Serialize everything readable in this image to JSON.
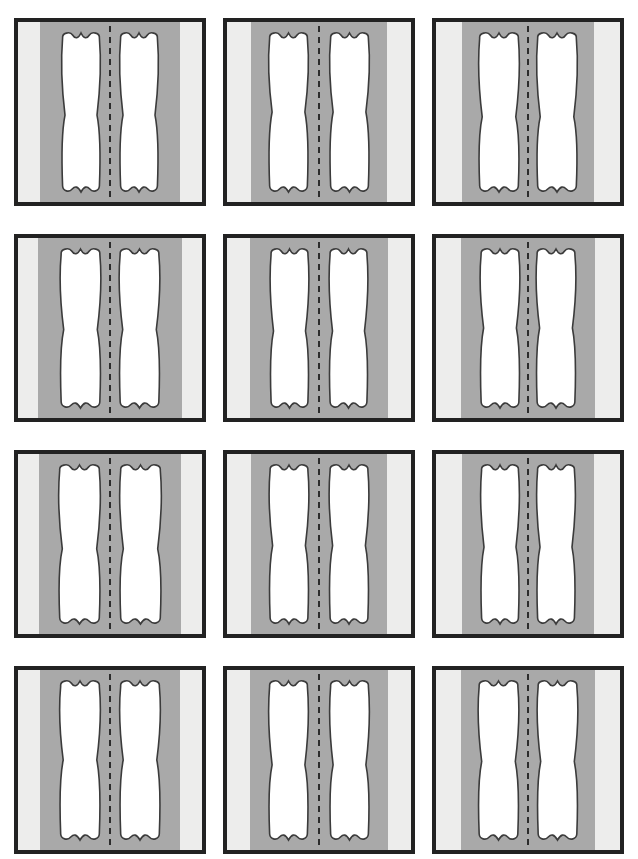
{
  "page": {
    "header_text": "",
    "background_color": "#ffffff",
    "width": 638,
    "height": 859
  },
  "grid": {
    "columns": 3,
    "rows": 4,
    "panel_count": 12,
    "panel_width": 192,
    "panel_height": 188
  },
  "palette": {
    "border": "#222222",
    "outer_band": "#ededec",
    "inner_band": "#a9a9a9",
    "shape_fill": "#ffffff",
    "shape_stroke": "#3b3b3b",
    "center_dash": "#1f1f1f"
  },
  "panel_legend": {
    "border_label": "panel-border",
    "outer_band_label": "outer light band",
    "inner_band_label": "inner gray matrix",
    "shape_label": "organic lumen shape",
    "center_label": "dashed symmetry axis"
  },
  "panels": [
    {
      "id": "panel-1",
      "index": "1",
      "inner_left": 22,
      "inner_right": 22,
      "shape_width": 40,
      "gap": 18,
      "waist": 0.52
    },
    {
      "id": "panel-2",
      "index": "2",
      "inner_left": 24,
      "inner_right": 24,
      "shape_width": 41,
      "gap": 20,
      "waist": 0.5
    },
    {
      "id": "panel-3",
      "index": "3",
      "inner_left": 26,
      "inner_right": 26,
      "shape_width": 42,
      "gap": 16,
      "waist": 0.53
    },
    {
      "id": "panel-4",
      "index": "4",
      "inner_left": 20,
      "inner_right": 20,
      "shape_width": 42,
      "gap": 17,
      "waist": 0.51
    },
    {
      "id": "panel-5",
      "index": "5",
      "inner_left": 23,
      "inner_right": 23,
      "shape_width": 40,
      "gap": 19,
      "waist": 0.52
    },
    {
      "id": "panel-6",
      "index": "6",
      "inner_left": 25,
      "inner_right": 25,
      "shape_width": 41,
      "gap": 15,
      "waist": 0.5
    },
    {
      "id": "panel-7",
      "index": "7",
      "inner_left": 21,
      "inner_right": 21,
      "shape_width": 43,
      "gap": 18,
      "waist": 0.53
    },
    {
      "id": "panel-8",
      "index": "8",
      "inner_left": 24,
      "inner_right": 24,
      "shape_width": 41,
      "gap": 19,
      "waist": 0.51
    },
    {
      "id": "panel-9",
      "index": "9",
      "inner_left": 26,
      "inner_right": 26,
      "shape_width": 40,
      "gap": 16,
      "waist": 0.52
    },
    {
      "id": "panel-10",
      "index": "10",
      "inner_left": 22,
      "inner_right": 22,
      "shape_width": 42,
      "gap": 18,
      "waist": 0.5
    },
    {
      "id": "panel-11",
      "index": "11",
      "inner_left": 23,
      "inner_right": 23,
      "shape_width": 41,
      "gap": 20,
      "waist": 0.53
    },
    {
      "id": "panel-12",
      "index": "12",
      "inner_left": 25,
      "inner_right": 25,
      "shape_width": 42,
      "gap": 17,
      "waist": 0.51
    }
  ]
}
